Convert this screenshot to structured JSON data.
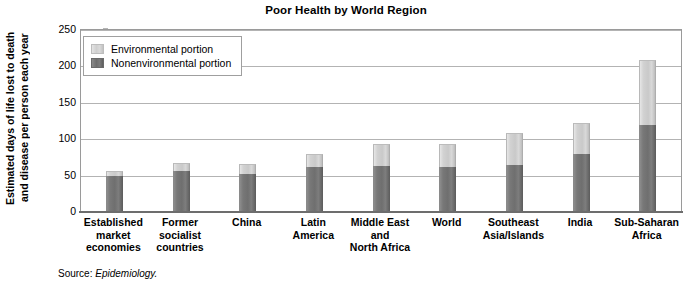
{
  "chart_data": {
    "type": "bar",
    "stacked": true,
    "title": "Poor Health by World Region",
    "xlabel": "",
    "ylabel": "Estimated days of life lost to death and disease per person each year",
    "ylabel_lines": [
      "Estimated days of life lost to death",
      "and disease per person each year"
    ],
    "ylim": [
      0,
      250
    ],
    "yticks": [
      0,
      50,
      100,
      150,
      200,
      250
    ],
    "grid": true,
    "legend_position": "top-left",
    "categories": [
      "Established market economies",
      "Former socialist countries",
      "China",
      "Latin America",
      "Middle East and North Africa",
      "World",
      "Southeast Asia/Islands",
      "India",
      "Sub-Saharan Africa"
    ],
    "category_label_lines": [
      [
        "Established",
        "market",
        "economies"
      ],
      [
        "Former",
        "socialist",
        "countries"
      ],
      [
        "China"
      ],
      [
        "Latin",
        "America"
      ],
      [
        "Middle East",
        "and",
        "North Africa"
      ],
      [
        "World"
      ],
      [
        "Southeast",
        "Asia/Islands"
      ],
      [
        "India"
      ],
      [
        "Sub-Saharan",
        "Africa"
      ]
    ],
    "series": [
      {
        "name": "Nonenvironmental portion",
        "color": "#6f6f6f",
        "values": [
          50,
          56,
          52,
          62,
          63,
          62,
          64,
          80,
          119
        ]
      },
      {
        "name": "Environmental portion",
        "color": "#cccccc",
        "values": [
          6,
          11,
          14,
          18,
          30,
          31,
          44,
          42,
          90
        ]
      }
    ],
    "totals": [
      56,
      67,
      66,
      80,
      93,
      93,
      108,
      122,
      209
    ]
  },
  "legend": {
    "items": [
      {
        "label": "Environmental portion",
        "swatch": "environmental-swatch"
      },
      {
        "label": "Nonenvironmental portion",
        "swatch": "nonenvironmental-swatch"
      }
    ]
  },
  "source": {
    "prefix": "Source:",
    "reference": "Epidemiology."
  }
}
